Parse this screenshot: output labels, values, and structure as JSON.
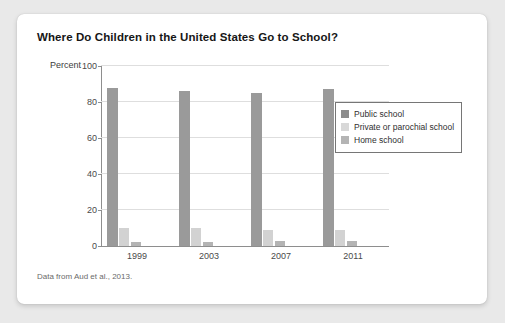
{
  "card": {
    "title": "Where Do Children in the United States Go to School?",
    "source_note": "Data from Aud et al., 2013."
  },
  "chart_data": {
    "type": "bar",
    "title": "Where Do Children in the United States Go to School?",
    "xlabel": "",
    "ylabel": "Percent",
    "ylim": [
      0,
      100
    ],
    "yticks": [
      0,
      20,
      40,
      60,
      80,
      100
    ],
    "grid": true,
    "legend_position": "top-right",
    "categories": [
      "1999",
      "2003",
      "2007",
      "2011"
    ],
    "series": [
      {
        "name": "Public school",
        "color": "#9a9a9a",
        "values": [
          88,
          86,
          85,
          87
        ]
      },
      {
        "name": "Private or parochial school",
        "color": "#d2d2d2",
        "values": [
          10,
          10,
          9,
          9
        ]
      },
      {
        "name": "Home school",
        "color": "#b4b4b4",
        "values": [
          2,
          2,
          3,
          3
        ]
      }
    ],
    "annotations": [
      "Data from Aud et al., 2013."
    ]
  }
}
